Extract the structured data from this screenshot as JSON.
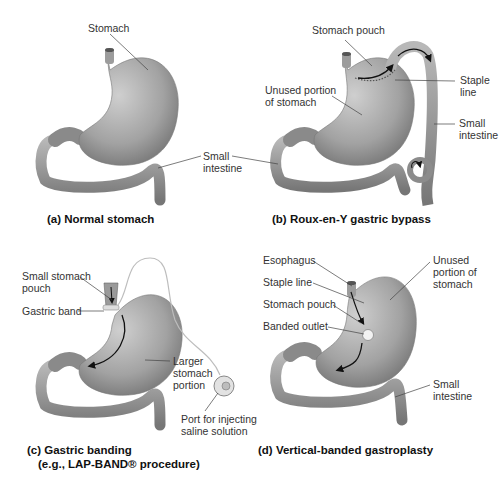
{
  "panels": {
    "a": {
      "caption": "(a) Normal stomach",
      "labels": {
        "stomach": "Stomach"
      }
    },
    "shared": {
      "small_intestine_line1": "Small",
      "small_intestine_line2": "intestine"
    },
    "b": {
      "caption": "(b) Roux-en-Y gastric bypass",
      "labels": {
        "stomach_pouch": "Stomach pouch",
        "unused_1": "Unused portion",
        "unused_2": "of stomach",
        "staple_1": "Staple",
        "staple_2": "line",
        "small_1": "Small",
        "small_2": "intestine"
      }
    },
    "c": {
      "caption_1": "(c) Gastric banding",
      "caption_2": "(e.g., LAP-BAND® procedure)",
      "labels": {
        "pouch_1": "Small stomach",
        "pouch_2": "pouch",
        "band": "Gastric band",
        "larger_1": "Larger",
        "larger_2": "stomach",
        "larger_3": "portion",
        "port_1": "Port for injecting",
        "port_2": "saline solution"
      }
    },
    "d": {
      "caption": "(d) Vertical-banded gastroplasty",
      "labels": {
        "esophagus": "Esophagus",
        "staple": "Staple line",
        "pouch": "Stomach pouch",
        "outlet": "Banded outlet",
        "unused_1": "Unused",
        "unused_2": "portion of",
        "unused_3": "stomach",
        "small_1": "Small",
        "small_2": "intestine"
      }
    }
  },
  "colors": {
    "organ": "#9a9a9a",
    "organ_dark": "#6f6f6f",
    "organ_light": "#c4c4c4",
    "leader": "#444444",
    "arrow": "#111111"
  }
}
